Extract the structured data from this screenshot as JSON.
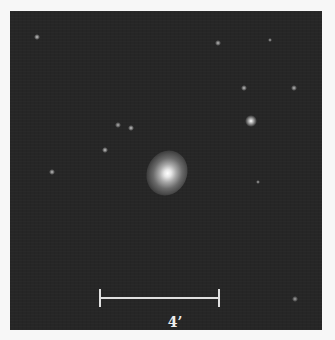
{
  "image": {
    "subject": "elliptical galaxy field",
    "background_color": "#262626",
    "page_color": "#f7f7f7"
  },
  "galaxy": {
    "x": 157,
    "y": 162,
    "color": "#ffffff"
  },
  "stars": [
    {
      "x": 27,
      "y": 26,
      "size": 3,
      "brightness": 0.6
    },
    {
      "x": 208,
      "y": 32,
      "size": 3,
      "brightness": 0.5
    },
    {
      "x": 260,
      "y": 29,
      "size": 2,
      "brightness": 0.4
    },
    {
      "x": 234,
      "y": 77,
      "size": 3,
      "brightness": 0.55
    },
    {
      "x": 284,
      "y": 77,
      "size": 3,
      "brightness": 0.5
    },
    {
      "x": 241,
      "y": 110,
      "size": 6,
      "brightness": 1.0
    },
    {
      "x": 108,
      "y": 114,
      "size": 3,
      "brightness": 0.45
    },
    {
      "x": 121,
      "y": 117,
      "size": 3,
      "brightness": 0.6
    },
    {
      "x": 95,
      "y": 139,
      "size": 3,
      "brightness": 0.6
    },
    {
      "x": 42,
      "y": 161,
      "size": 3,
      "brightness": 0.55
    },
    {
      "x": 248,
      "y": 171,
      "size": 2,
      "brightness": 0.4
    },
    {
      "x": 285,
      "y": 288,
      "size": 3,
      "brightness": 0.35
    }
  ],
  "scale_bar": {
    "label": "4’",
    "color": "#e0e0e0"
  }
}
